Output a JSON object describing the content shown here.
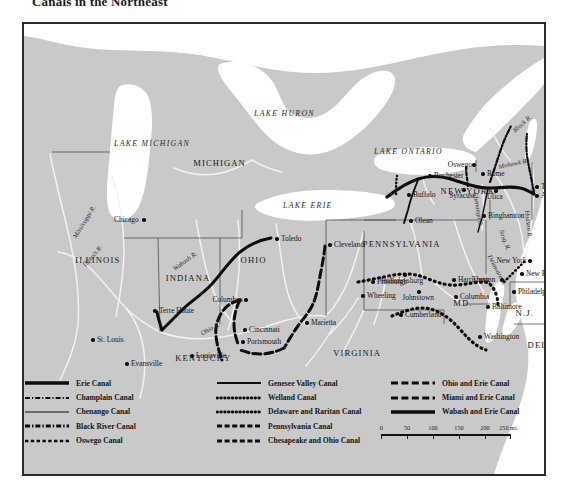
{
  "title": "Canals in the Northeast",
  "map": {
    "frame_color": "#2b2b2b",
    "land_color": "#c9c9c9",
    "water_color": "#ffffff",
    "lakes": [
      {
        "name": "LAKE MICHIGAN",
        "x": 118,
        "y": 116
      },
      {
        "name": "LAKE HURON",
        "x": 258,
        "y": 86
      },
      {
        "name": "LAKE ERIE",
        "x": 287,
        "y": 178
      },
      {
        "name": "LAKE ONTARIO",
        "x": 378,
        "y": 124
      }
    ],
    "states": [
      {
        "name": "MICHIGAN",
        "x": 190,
        "y": 135
      },
      {
        "name": "ILLINOIS",
        "x": 72,
        "y": 232
      },
      {
        "name": "INDIANA",
        "x": 160,
        "y": 250
      },
      {
        "name": "OHIO",
        "x": 227,
        "y": 232
      },
      {
        "name": "KENTUCKY",
        "x": 172,
        "y": 330
      },
      {
        "name": "VIRGINIA",
        "x": 330,
        "y": 325
      },
      {
        "name": "PENNSYLVANIA",
        "x": 370,
        "y": 216
      },
      {
        "name": "NEW  YORK",
        "x": 440,
        "y": 163
      },
      {
        "name": "MD.",
        "x": 437,
        "y": 275
      },
      {
        "name": "DEL.",
        "x": 514,
        "y": 317
      },
      {
        "name": "N.J.",
        "x": 502,
        "y": 285
      }
    ],
    "rivers": [
      {
        "name": "Mississippi R.",
        "x": 48,
        "y": 212,
        "rot": -58
      },
      {
        "name": "Illinois R.",
        "x": 58,
        "y": 240,
        "rot": -50
      },
      {
        "name": "Wabash R.",
        "x": 148,
        "y": 243,
        "rot": -36
      },
      {
        "name": "Ohio R.",
        "x": 176,
        "y": 307,
        "rot": -28
      },
      {
        "name": "Mohawk R.",
        "x": 474,
        "y": 140,
        "rot": -12
      },
      {
        "name": "Hudson R.",
        "x": 506,
        "y": 186,
        "rot": 84
      },
      {
        "name": "Black R.",
        "x": 488,
        "y": 105,
        "rot": -42
      },
      {
        "name": "Chenango R.",
        "x": 454,
        "y": 168,
        "rot": 80
      },
      {
        "name": "Delaware R.",
        "x": 468,
        "y": 230,
        "rot": 62
      },
      {
        "name": "Susq. R.",
        "x": 480,
        "y": 205,
        "rot": 70
      }
    ],
    "cities": [
      {
        "name": "Chicago",
        "x": 120,
        "y": 196,
        "side": "left"
      },
      {
        "name": "St. Louis",
        "x": 69,
        "y": 316,
        "side": "right"
      },
      {
        "name": "Terre Haute",
        "x": 131,
        "y": 287,
        "side": "right"
      },
      {
        "name": "Evansville",
        "x": 103,
        "y": 340,
        "side": "right"
      },
      {
        "name": "Louisville",
        "x": 168,
        "y": 332,
        "side": "right"
      },
      {
        "name": "Cincinnati",
        "x": 221,
        "y": 306,
        "side": "right"
      },
      {
        "name": "Columbus",
        "x": 222,
        "y": 276,
        "side": "left"
      },
      {
        "name": "Portsmouth",
        "x": 219,
        "y": 318,
        "side": "right"
      },
      {
        "name": "Marietta",
        "x": 283,
        "y": 299,
        "side": "right"
      },
      {
        "name": "Toledo",
        "x": 253,
        "y": 215,
        "side": "right"
      },
      {
        "name": "Cleveland",
        "x": 306,
        "y": 221,
        "side": "right"
      },
      {
        "name": "Pittsburgh",
        "x": 349,
        "y": 258,
        "side": "right"
      },
      {
        "name": "Wheeling",
        "x": 339,
        "y": 272,
        "side": "right"
      },
      {
        "name": "Hollidaysburg",
        "x": 381,
        "y": 251,
        "side": "center"
      },
      {
        "name": "Johnstown",
        "x": 395,
        "y": 268,
        "side": "center"
      },
      {
        "name": "Harrisburg",
        "x": 430,
        "y": 256,
        "side": "right"
      },
      {
        "name": "Columbia",
        "x": 432,
        "y": 273,
        "side": "right"
      },
      {
        "name": "Cumberland",
        "x": 377,
        "y": 291,
        "side": "right"
      },
      {
        "name": "Baltimore",
        "x": 464,
        "y": 283,
        "side": "right"
      },
      {
        "name": "Washington",
        "x": 456,
        "y": 313,
        "side": "right"
      },
      {
        "name": "Olean",
        "x": 387,
        "y": 197,
        "side": "right"
      },
      {
        "name": "Buffalo",
        "x": 385,
        "y": 171,
        "side": "right"
      },
      {
        "name": "Rochester",
        "x": 406,
        "y": 152,
        "side": "right"
      },
      {
        "name": "Oswego",
        "x": 450,
        "y": 141,
        "side": "left"
      },
      {
        "name": "Rome",
        "x": 459,
        "y": 150,
        "side": "right"
      },
      {
        "name": "Syracuse",
        "x": 440,
        "y": 166,
        "side": "center"
      },
      {
        "name": "Utica",
        "x": 472,
        "y": 167,
        "side": "center"
      },
      {
        "name": "Binghamton",
        "x": 460,
        "y": 192,
        "side": "right"
      },
      {
        "name": "Troy",
        "x": 513,
        "y": 163,
        "side": "right"
      },
      {
        "name": "Albany",
        "x": 513,
        "y": 172,
        "side": "right"
      },
      {
        "name": "New York",
        "x": 506,
        "y": 237,
        "side": "left"
      },
      {
        "name": "New Brunswick",
        "x": 498,
        "y": 250,
        "side": "right"
      },
      {
        "name": "Trenton",
        "x": 478,
        "y": 256,
        "side": "left"
      },
      {
        "name": "Philadelphia",
        "x": 490,
        "y": 268,
        "side": "right"
      }
    ]
  },
  "legend": {
    "columns": [
      {
        "items": [
          {
            "label": "Erie Canal",
            "style": "solid-thick"
          },
          {
            "label": "Champlain Canal",
            "style": "dash-dot"
          },
          {
            "label": "Chenango Canal",
            "style": "solid-thin"
          },
          {
            "label": "Black River Canal",
            "style": "dash-dot-heavy"
          },
          {
            "label": "Oswego Canal",
            "style": "dash-short"
          }
        ]
      },
      {
        "items": [
          {
            "label": "Genesee Valley Canal",
            "style": "solid-med"
          },
          {
            "label": "Welland Canal",
            "style": "dotted"
          },
          {
            "label": "Delaware and Raritan Canal",
            "style": "dotted"
          },
          {
            "label": "Pennsylvania Canal",
            "style": "dash-block"
          },
          {
            "label": "Chesapeake and Ohio Canal",
            "style": "dash-block"
          }
        ]
      },
      {
        "items": [
          {
            "label": "Ohio and Erie Canal",
            "style": "dash-long"
          },
          {
            "label": "Miami and Erie Canal",
            "style": "dash-long"
          },
          {
            "label": "Wabash and Erie Canal",
            "style": "solid-thick"
          }
        ]
      }
    ]
  },
  "scale": {
    "ticks": [
      "0",
      "50",
      "100",
      "150",
      "200",
      "250 mi."
    ],
    "unit": "mi."
  }
}
